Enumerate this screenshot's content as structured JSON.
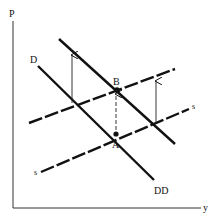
{
  "diagram": {
    "axes": {
      "y_label": "P",
      "x_label": "y"
    },
    "demand_curves": [
      {
        "name": "D",
        "label": "D",
        "x1": 38,
        "y1": 66,
        "x2": 154,
        "y2": 180
      },
      {
        "name": "DD",
        "label": "DD",
        "x1": 59,
        "y1": 39,
        "x2": 175,
        "y2": 144
      }
    ],
    "supply_curves": [
      {
        "name": "s",
        "label_left": "s",
        "label_right": "s",
        "style": "dashed",
        "x1": 41,
        "y1": 172,
        "x2": 189,
        "y2": 109
      },
      {
        "name": "s-shifted",
        "style": "dashed",
        "x1": 29,
        "y1": 123,
        "x2": 175,
        "y2": 69
      }
    ],
    "points": [
      {
        "label": "A",
        "x": 116,
        "y": 134
      },
      {
        "label": "B",
        "x": 117,
        "y": 90
      }
    ],
    "arrows": [
      {
        "style": "solid",
        "x": 72,
        "from_y": 103,
        "to_y": 55
      },
      {
        "style": "dashed",
        "x": 116,
        "from_y": 130,
        "to_y": 94
      },
      {
        "style": "solid",
        "x": 156,
        "from_y": 124,
        "to_y": 81
      }
    ],
    "colors": {
      "ink": "#111111",
      "background": "#ffffff"
    }
  }
}
